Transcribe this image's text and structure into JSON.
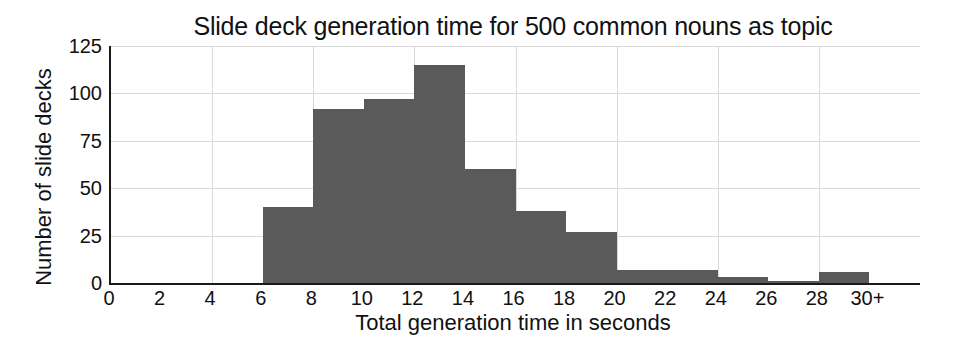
{
  "chart_data": {
    "type": "bar",
    "title": "Slide deck generation time for 500 common nouns as topic",
    "xlabel": "Total generation time in seconds",
    "ylabel": "Number of slide decks",
    "subtitle": "",
    "xlim": [
      0,
      32
    ],
    "ylim": [
      0,
      125
    ],
    "grid": true,
    "legend": "none",
    "bar_color": "#5a5a5a",
    "bin_width": 2,
    "xticks": [
      "0",
      "2",
      "4",
      "6",
      "8",
      "10",
      "12",
      "14",
      "16",
      "18",
      "20",
      "22",
      "24",
      "26",
      "28",
      "30+"
    ],
    "xtick_values": [
      0,
      2,
      4,
      6,
      8,
      10,
      12,
      14,
      16,
      18,
      20,
      22,
      24,
      26,
      28,
      30
    ],
    "yticks": [
      "0",
      "25",
      "50",
      "75",
      "100",
      "125"
    ],
    "ytick_values": [
      0,
      25,
      50,
      75,
      100,
      125
    ],
    "categories": [
      "0-2",
      "2-4",
      "4-6",
      "6-8",
      "8-10",
      "10-12",
      "12-14",
      "14-16",
      "16-18",
      "18-20",
      "20-22",
      "22-24",
      "24-26",
      "26-28",
      "28-30",
      "30-32"
    ],
    "bin_starts": [
      0,
      2,
      4,
      6,
      8,
      10,
      12,
      14,
      16,
      18,
      20,
      22,
      24,
      26,
      28,
      30
    ],
    "values": [
      0,
      0,
      0,
      40,
      92,
      97,
      115,
      60,
      38,
      27,
      7,
      7,
      3,
      1,
      6,
      0
    ]
  },
  "figure": {
    "background": "#ffffff",
    "axis_color": "#1a1a1a",
    "grid_color": "#d9d9d9",
    "text_color": "#111111"
  }
}
